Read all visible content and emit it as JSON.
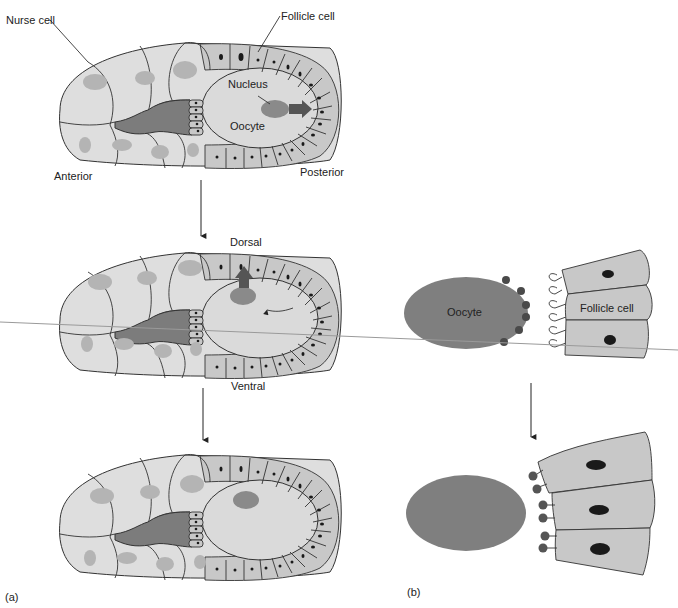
{
  "panel_a": {
    "label": "(a)",
    "stage1": {
      "labels": {
        "nurse_cell": "Nurse cell",
        "follicle_cell": "Follicle cell",
        "nucleus": "Nucleus",
        "oocyte": "Oocyte",
        "anterior": "Anterior",
        "posterior": "Posterior"
      }
    },
    "stage2": {
      "labels": {
        "dorsal": "Dorsal",
        "ventral": "Ventral"
      }
    },
    "stage3": {}
  },
  "panel_b": {
    "label": "(b)",
    "top": {
      "oocyte_label": "Oocyte",
      "follicle_label": "Follicle cell"
    }
  },
  "colors": {
    "nurse_cell": "#dedede",
    "nurse_nucleus": "#b4b4b4",
    "follicle_cell": "#c8c8c8",
    "oocyte_cytoplasm": "#dadada",
    "ring_canal_region": "#7c7c7c",
    "oocyte_b": "#7f7f7f",
    "dark_nucleus": "#1a1a1a"
  }
}
